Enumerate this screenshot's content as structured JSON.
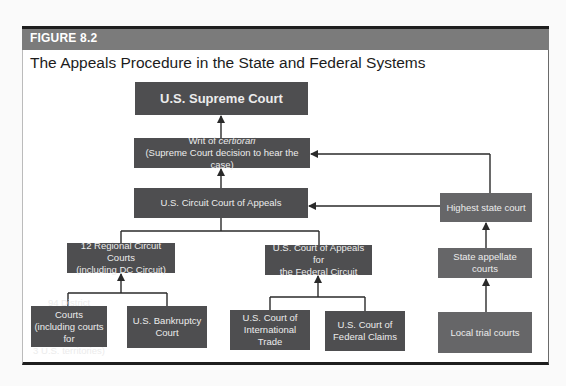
{
  "figure": {
    "label": "FIGURE 8.2",
    "title": "The Appeals Procedure in the State and Federal Systems"
  },
  "nodes": {
    "supreme_court": {
      "line1": "U.S. Supreme Court"
    },
    "writ": {
      "line1_prefix": "Writ of ",
      "line1_italic": "certiorari",
      "line2": "(Supreme Court decision to hear the case)"
    },
    "circuit_appeals": {
      "line1": "U.S. Circuit Court of Appeals"
    },
    "regional_circuits": {
      "line1": "12 Regional Circuit Courts",
      "line2": "(including DC Circuit)"
    },
    "federal_circuit": {
      "line1": "U.S. Court of Appeals for",
      "line2": "the Federal Circuit"
    },
    "district_courts": {
      "line1": "94 District Courts",
      "line2": "(including courts for",
      "line3": "3 U.S. territories)"
    },
    "bankruptcy": {
      "line1": "U.S. Bankruptcy",
      "line2": "Court"
    },
    "intl_trade": {
      "line1": "U.S. Court of",
      "line2": "International Trade"
    },
    "federal_claims": {
      "line1": "U.S. Court of",
      "line2": "Federal Claims"
    },
    "highest_state": {
      "line1": "Highest state court"
    },
    "state_appellate": {
      "line1": "State appellate courts"
    },
    "local_trial": {
      "line1": "Local trial courts"
    }
  },
  "colors": {
    "box_federal": "#4e4e50",
    "box_state": "#666668",
    "header_band": "#7b7b7b",
    "line": "#2a2a2a"
  }
}
